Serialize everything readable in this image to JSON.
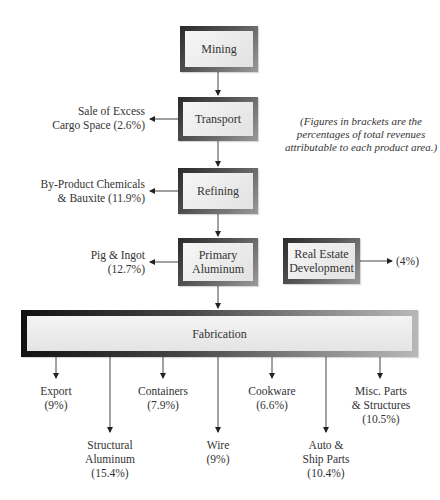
{
  "diagram": {
    "type": "flowchart",
    "note": {
      "line1": "(Figures in brackets are the",
      "line2": "percentages of total revenues",
      "line3": "attributable to each product area.)"
    },
    "nodes": {
      "mining": "Mining",
      "transport": "Transport",
      "refining": "Refining",
      "primary_aluminum_1": "Primary",
      "primary_aluminum_2": "Aluminum",
      "real_estate_1": "Real Estate",
      "real_estate_2": "Development",
      "fabrication": "Fabrication"
    },
    "side_outputs": {
      "transport": {
        "line1": "Sale of Excess",
        "line2": "Cargo Space (2.6%)"
      },
      "refining": {
        "line1": "By-Product Chemicals",
        "line2": "& Bauxite (11.9%)"
      },
      "primary_aluminum": {
        "line1": "Pig & Ingot",
        "line2": "(12.7%)"
      },
      "real_estate": {
        "line1": "(4%)"
      }
    },
    "fabrication_outputs": [
      {
        "line1": "Export",
        "line2": "(9%)"
      },
      {
        "line1": "Structural",
        "line2": "Aluminum",
        "line3": "(15.4%)"
      },
      {
        "line1": "Containers",
        "line2": "(7.9%)"
      },
      {
        "line1": "Wire",
        "line2": "(9%)"
      },
      {
        "line1": "Cookware",
        "line2": "(6.6%)"
      },
      {
        "line1": "Auto &",
        "line2": "Ship Parts",
        "line3": "(10.4%)"
      },
      {
        "line1": "Misc. Parts",
        "line2": "& Structures",
        "line3": "(10.5%)"
      }
    ]
  }
}
